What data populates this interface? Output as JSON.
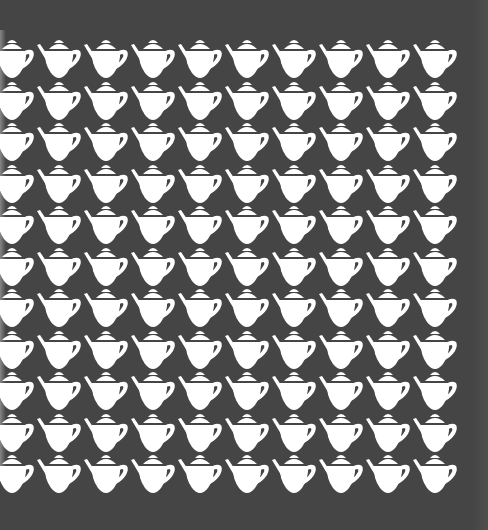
{
  "pattern": {
    "name": "teapot-pattern",
    "motif": "teapot-icon",
    "background_color": "#454545",
    "motif_color": "#ffffff",
    "columns": 10,
    "rows": 11,
    "origin_x": -12,
    "origin_y": 37,
    "pitch_x": 47,
    "pitch_y": 41.5
  }
}
